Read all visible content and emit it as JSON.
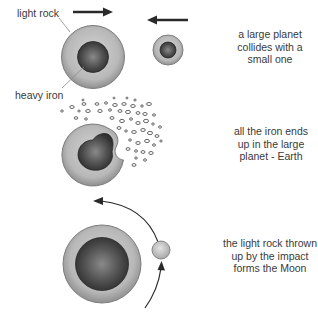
{
  "labels": {
    "light_rock": "light rock",
    "heavy_iron": "heavy iron"
  },
  "steps": [
    {
      "caption_lines": [
        "a large planet",
        "collides with a",
        "small one"
      ]
    },
    {
      "caption_lines": [
        "all the iron ends",
        "up in the large",
        "planet - Earth"
      ]
    },
    {
      "caption_lines": [
        "the light rock thrown",
        "up by the impact",
        "forms the Moon"
      ]
    }
  ],
  "colors": {
    "rock": "#b9b9b9",
    "rock_edge": "#7d7d7d",
    "iron": "#4a4a4a",
    "arrow": "#2a2a2a",
    "text": "#3a3a3a"
  }
}
